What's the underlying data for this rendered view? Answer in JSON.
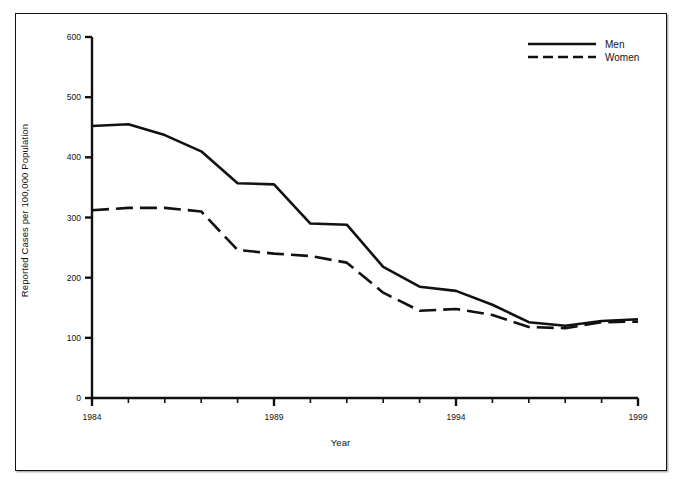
{
  "chart_data": {
    "type": "line",
    "title": "",
    "subtitle": "",
    "xlabel": "Year",
    "ylabel": "Reported Cases per 100,000 Population",
    "xlim": [
      1984,
      1999
    ],
    "ylim": [
      0,
      600
    ],
    "xticks": [
      1984,
      1985,
      1986,
      1987,
      1988,
      1989,
      1990,
      1991,
      1992,
      1993,
      1994,
      1995,
      1996,
      1997,
      1998,
      1999
    ],
    "xtick_labels": [
      "1984",
      "",
      "",
      "",
      "",
      "1989",
      "",
      "",
      "",
      "",
      "1994",
      "",
      "",
      "",
      "",
      "1999"
    ],
    "yticks": [
      0,
      100,
      200,
      300,
      400,
      500,
      600
    ],
    "ytick_labels": [
      "0",
      "100",
      "200",
      "300",
      "400",
      "500",
      "600"
    ],
    "grid": false,
    "legend_position": "top-right",
    "x": [
      1984,
      1985,
      1986,
      1987,
      1988,
      1989,
      1990,
      1991,
      1992,
      1993,
      1994,
      1995,
      1996,
      1997,
      1998,
      1999
    ],
    "series": [
      {
        "name": "Men",
        "style": "solid",
        "color": "#111111",
        "values": [
          452,
          455,
          437,
          410,
          357,
          355,
          290,
          288,
          218,
          185,
          178,
          155,
          126,
          120,
          128,
          131
        ]
      },
      {
        "name": "Women",
        "style": "dashed",
        "color": "#111111",
        "values": [
          312,
          316,
          316,
          310,
          246,
          240,
          236,
          225,
          175,
          145,
          148,
          138,
          118,
          116,
          126,
          127
        ]
      }
    ]
  },
  "legend": {
    "entries": [
      {
        "label": "Men",
        "style": "solid"
      },
      {
        "label": "Women",
        "style": "dashed"
      }
    ]
  },
  "axes": {
    "x_title": "Year",
    "y_title": "Reported Cases per 100,000 Population"
  }
}
